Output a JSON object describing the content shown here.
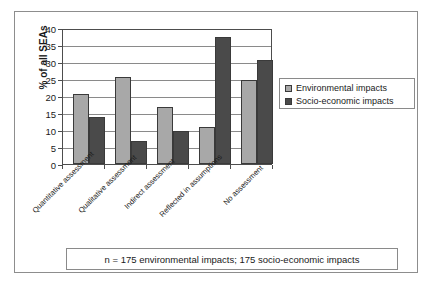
{
  "chart_data": {
    "type": "bar",
    "title": "",
    "subtitle": "",
    "xlabel": "",
    "ylabel": "% of all SEAs",
    "ylim": [
      0,
      40
    ],
    "yticks": [
      0,
      5,
      10,
      15,
      20,
      25,
      30,
      35,
      40
    ],
    "ytick_labels": [
      "0",
      "5",
      "10",
      "15",
      "20",
      "25",
      "30",
      "35",
      "40"
    ],
    "grid": true,
    "grid_axis": "y",
    "legend_position": "right",
    "categories": [
      "Quantitative assessment",
      "Qualitative assessment",
      "Indirect assessment",
      "Reflected in assumptions",
      "No assessment"
    ],
    "series": [
      {
        "name": "Environmental impacts",
        "color": "#a8a8a8",
        "values": [
          21,
          26,
          17,
          11,
          25
        ]
      },
      {
        "name": "Socio-economic impacts",
        "color": "#4a4a4a",
        "values": [
          14,
          7,
          10,
          38,
          31
        ]
      }
    ],
    "annotation": "n = 175 environmental impacts; 175 socio-economic impacts"
  },
  "axes": {
    "y_title": "% of all SEAs",
    "y_tick_0": "0",
    "y_tick_1": "5",
    "y_tick_2": "10",
    "y_tick_3": "15",
    "y_tick_4": "20",
    "y_tick_5": "25",
    "y_tick_6": "30",
    "y_tick_7": "35",
    "y_tick_8": "40"
  },
  "categories": {
    "c0": "Quantitative assessment",
    "c1": "Qualitative assessment",
    "c2": "Indirect assessment",
    "c3": "Reflected in assumptions",
    "c4": "No assessment"
  },
  "legend": {
    "entry_0": "Environmental impacts",
    "entry_1": "Socio-economic impacts"
  },
  "footer": {
    "note": "n = 175 environmental impacts; 175 socio-economic impacts"
  },
  "colors": {
    "environmental": "#a8a8a8",
    "socio_economic": "#4a4a4a",
    "axis": "#4d4d4d",
    "grid": "#8a8a8a",
    "frame": "#8d8d8d",
    "text": "#1a1a1a",
    "background": "#ffffff"
  }
}
